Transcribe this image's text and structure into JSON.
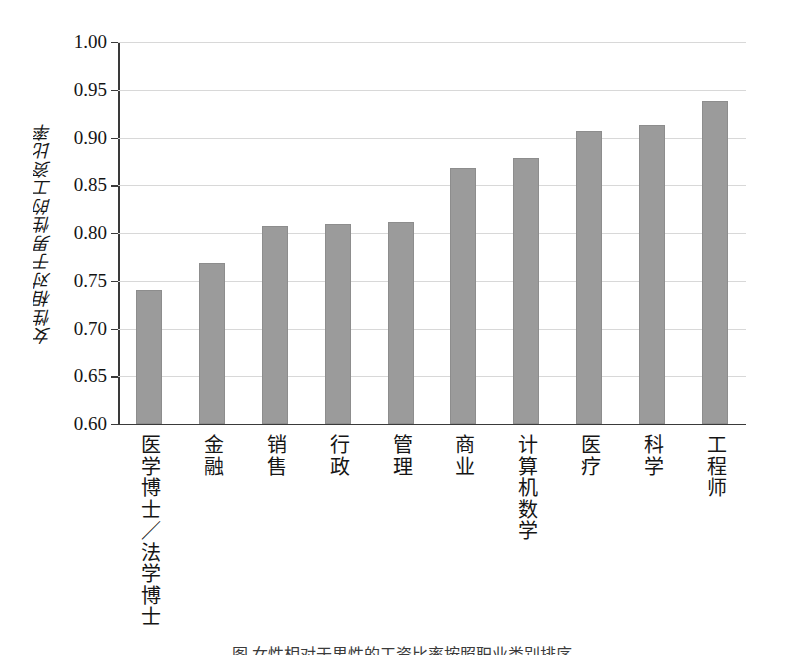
{
  "chart_data": {
    "type": "bar",
    "title": "",
    "xlabel": "",
    "ylabel": "女性相对于男性的工资比率",
    "ylim": [
      0.6,
      1.0
    ],
    "ytick_step": 0.05,
    "grid": true,
    "legend": "none",
    "bar_color": "#9b9b9b",
    "axis_color": "#3a3a3a",
    "grid_color": "#d8d8d8",
    "categories": [
      "医学博士／法学博士",
      "金融",
      "销售",
      "行政",
      "管理",
      "商业",
      "计算机数学",
      "医疗",
      "科学",
      "工程师"
    ],
    "values": [
      0.74,
      0.769,
      0.807,
      0.809,
      0.812,
      0.868,
      0.879,
      0.907,
      0.913,
      0.938
    ],
    "ytick_labels": [
      "0.60",
      "0.65",
      "0.70",
      "0.75",
      "0.80",
      "0.85",
      "0.90",
      "0.95",
      "1.00"
    ],
    "ytick_values": [
      0.6,
      0.65,
      0.7,
      0.75,
      0.8,
      0.85,
      0.9,
      0.95,
      1.0
    ]
  },
  "caption": {
    "text": "图 女性相对于男性的工资比率按照职业类别排序"
  }
}
